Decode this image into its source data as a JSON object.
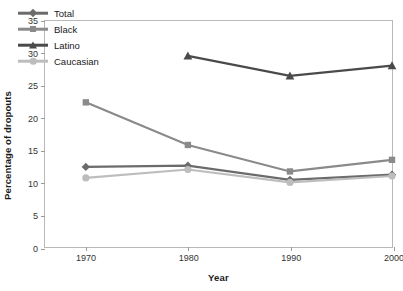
{
  "chart_data": {
    "type": "line",
    "title": "",
    "xlabel": "Year",
    "ylabel": "Percentage of dropouts",
    "x": [
      1970,
      1980,
      1990,
      2000
    ],
    "xtick_labels": [
      "1970",
      "1980",
      "1990",
      "2000"
    ],
    "ytick_labels": [
      "0",
      "5",
      "10",
      "15",
      "20",
      "25",
      "30",
      "35"
    ],
    "yticks": [
      0,
      5,
      10,
      15,
      20,
      25,
      30,
      35
    ],
    "ylim": [
      0,
      35
    ],
    "xlim": [
      1966,
      2000
    ],
    "grid": false,
    "legend_position": "upper-left-inside",
    "series": [
      {
        "name": "Total",
        "marker": "diamond",
        "color": "#6b6b6b",
        "x": [
          1970,
          1980,
          1990,
          2000
        ],
        "values": [
          12.4,
          12.6,
          10.4,
          11.2
        ]
      },
      {
        "name": "Black",
        "marker": "square",
        "color": "#8a8a8a",
        "x": [
          1970,
          1980,
          1990,
          2000
        ],
        "values": [
          22.4,
          15.8,
          11.7,
          13.5
        ]
      },
      {
        "name": "Latino",
        "marker": "triangle",
        "color": "#4a4a4a",
        "x": [
          1980,
          1990,
          2000
        ],
        "values": [
          29.6,
          26.5,
          28.1
        ]
      },
      {
        "name": "Caucasian",
        "marker": "circle",
        "color": "#bdbdbd",
        "x": [
          1970,
          1980,
          1990,
          2000
        ],
        "values": [
          10.7,
          12.0,
          10.0,
          11.0
        ]
      }
    ]
  },
  "colors": {
    "axis": "#b8b8b8",
    "tick": "#9a9a9a",
    "text": "#1a1a1a",
    "tick_text": "#333333",
    "background": "#ffffff"
  }
}
